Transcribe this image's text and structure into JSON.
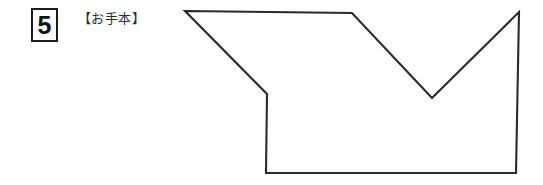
{
  "page": {
    "background_color": "#ffffff",
    "width": 543,
    "height": 185
  },
  "question": {
    "number": "5",
    "example_label": "【お手本】",
    "box_border_color": "#1a1a1a",
    "number_color": "#111111",
    "label_color": "#2b2b2b"
  },
  "figure": {
    "name": "model-polygon",
    "stroke_color": "#2a2a2a",
    "fill_color": "#ffffff",
    "stroke_width": 2.1,
    "points": "185,11 352,13 432,98 519,12 516,173 266,173 267,94",
    "vertices": [
      {
        "label": "top-left",
        "x": 185,
        "y": 11
      },
      {
        "label": "top-middle",
        "x": 352,
        "y": 13
      },
      {
        "label": "notch-bottom",
        "x": 432,
        "y": 98
      },
      {
        "label": "top-right",
        "x": 519,
        "y": 12
      },
      {
        "label": "bottom-right",
        "x": 516,
        "y": 173
      },
      {
        "label": "bottom-left",
        "x": 266,
        "y": 173
      },
      {
        "label": "step-corner",
        "x": 267,
        "y": 94
      }
    ]
  }
}
